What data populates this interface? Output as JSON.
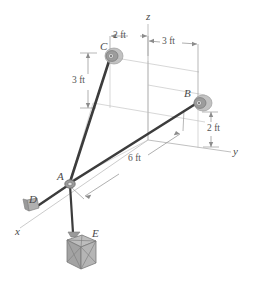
{
  "figure": {
    "background_color": "#ffffff",
    "cable_color": "#3c3c3c",
    "axis_color": "#9a9a9a",
    "dimension_color": "#8c8c8c",
    "pulley_color": "#9e9e9e",
    "crate_color": "#a8a8a8",
    "label_color": "#4a4a4a"
  },
  "axes": [
    {
      "name": "z-axis",
      "label": "z",
      "x": 146,
      "y": 16
    },
    {
      "name": "y-axis",
      "label": "y",
      "x": 233,
      "y": 152
    },
    {
      "name": "x-axis",
      "label": "x",
      "x": 15,
      "y": 232
    }
  ],
  "points": [
    {
      "name": "point-a",
      "label": "A",
      "x": 60,
      "y": 176,
      "kind": "ring"
    },
    {
      "name": "point-b",
      "label": "B",
      "x": 185,
      "y": 93,
      "kind": "pulley"
    },
    {
      "name": "point-c",
      "label": "C",
      "x": 101,
      "y": 46,
      "kind": "pulley"
    },
    {
      "name": "point-d",
      "label": "D",
      "x": 30,
      "y": 200,
      "kind": "block"
    },
    {
      "name": "point-e",
      "label": "E",
      "x": 92,
      "y": 233,
      "kind": "crate"
    }
  ],
  "dimensions": [
    {
      "name": "dim-c-to-z",
      "label": "2 ft",
      "x": 112,
      "y": 38,
      "orientation": "horizontal"
    },
    {
      "name": "dim-z-to-b",
      "label": "3 ft",
      "x": 163,
      "y": 48,
      "orientation": "horizontal"
    },
    {
      "name": "dim-c-height",
      "label": "3 ft",
      "x": 74,
      "y": 80,
      "orientation": "vertical"
    },
    {
      "name": "dim-b-height",
      "label": "2 ft",
      "x": 209,
      "y": 128,
      "orientation": "vertical"
    },
    {
      "name": "dim-a-to-b",
      "label": "6 ft",
      "x": 132,
      "y": 158,
      "orientation": "oblique"
    }
  ]
}
